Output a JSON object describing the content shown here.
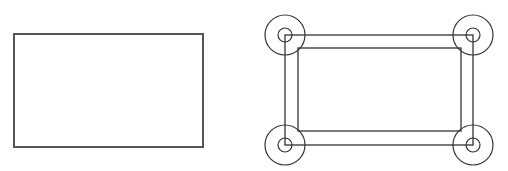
{
  "diagram": {
    "stroke_color": "#333333",
    "left_stroke_color": "#555555",
    "background": "#ffffff",
    "left_rectangle": {
      "x": 14,
      "y": 34,
      "width": 189,
      "height": 113,
      "stroke_width": 2
    },
    "right_figure": {
      "outer_rectangle": {
        "x": 285,
        "y": 35,
        "width": 188,
        "height": 110,
        "stroke_width": 1.3
      },
      "inner_rectangle": {
        "x": 298,
        "y": 48,
        "width": 163,
        "height": 83,
        "stroke_width": 1.3
      },
      "corner_joints": [
        {
          "name": "top-left",
          "cx": 285,
          "cy": 35,
          "outer_r": 20,
          "inner_r": 7
        },
        {
          "name": "top-right",
          "cx": 473,
          "cy": 35,
          "outer_r": 20,
          "inner_r": 7
        },
        {
          "name": "bottom-left",
          "cx": 285,
          "cy": 145,
          "outer_r": 20,
          "inner_r": 7
        },
        {
          "name": "bottom-right",
          "cx": 473,
          "cy": 145,
          "outer_r": 20,
          "inner_r": 7
        }
      ]
    }
  }
}
